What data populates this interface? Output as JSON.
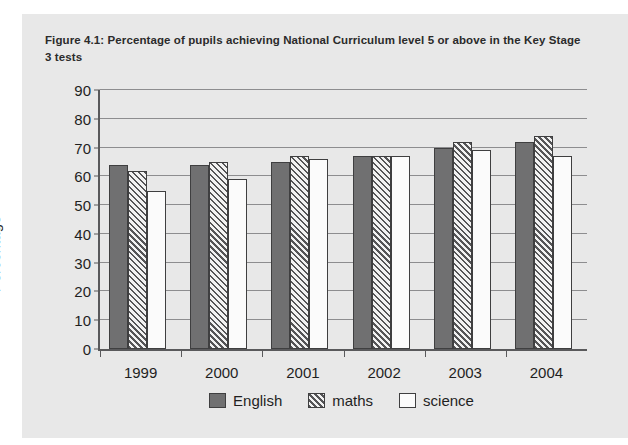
{
  "figure": {
    "title": "Figure 4.1: Percentage of pupils achieving National Curriculum level 5 or above in the Key Stage 3 tests"
  },
  "colors": {
    "panel_background": "#e8e8e8",
    "english": "#707071",
    "maths_hatch": "#555557",
    "maths_fill": "#f2f2f2",
    "science": "#fbfbfb",
    "axis": "#59595b",
    "gridline": "#8d8d8f",
    "text": "#1f1f1f"
  },
  "chart_data": {
    "type": "bar",
    "title": "Figure 4.1: Percentage of pupils achieving National Curriculum level 5 or above in the Key Stage 3 tests",
    "xlabel": "",
    "ylabel": "Percentage",
    "ylim": [
      0,
      90
    ],
    "yticks": [
      0,
      10,
      20,
      30,
      40,
      50,
      60,
      70,
      80,
      90
    ],
    "ytick_labels": [
      "0",
      "10",
      "20",
      "30",
      "40",
      "50",
      "60",
      "70",
      "80",
      "90"
    ],
    "grid": true,
    "legend_position": "bottom",
    "categories": [
      "1999",
      "2000",
      "2001",
      "2002",
      "2003",
      "2004"
    ],
    "series": [
      {
        "name": "English",
        "values": [
          64,
          64,
          65,
          67,
          70,
          72
        ]
      },
      {
        "name": "maths",
        "values": [
          62,
          65,
          67,
          67,
          72,
          74
        ]
      },
      {
        "name": "science",
        "values": [
          55,
          59,
          66,
          67,
          69,
          67
        ]
      }
    ]
  },
  "legend": {
    "items": [
      {
        "label": "English",
        "style": "english"
      },
      {
        "label": "maths",
        "style": "maths"
      },
      {
        "label": "science",
        "style": "science"
      }
    ]
  }
}
